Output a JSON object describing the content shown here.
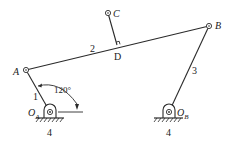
{
  "diagram": {
    "type": "four-bar linkage",
    "colors": {
      "line": "#2a2a2a",
      "background": "#ffffff"
    },
    "points": {
      "A": {
        "label": "A"
      },
      "B": {
        "label": "B"
      },
      "C": {
        "label": "C"
      },
      "D": {
        "label": "D"
      },
      "OA": {
        "label": "O",
        "sub": "A"
      },
      "OB": {
        "label": "O",
        "sub": "B"
      }
    },
    "links": {
      "link1": "1",
      "link2": "2",
      "link3": "3",
      "ground_left": "4",
      "ground_right": "4"
    },
    "angle": {
      "value": "120°"
    }
  }
}
